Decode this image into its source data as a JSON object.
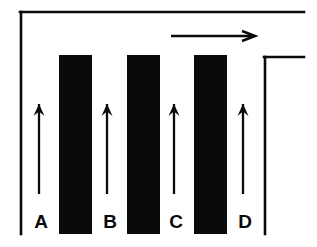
{
  "figure": {
    "background_color": "#ffffff",
    "ink_color": "#0a0a0a",
    "width": 317,
    "height": 247
  },
  "frame": {
    "name": "outer-boundary",
    "stroke_color": "#0a0a0a",
    "stroke_width": 2.6,
    "top_rail": {
      "x1": 20,
      "y1": 12,
      "x2": 304,
      "y2": 12
    },
    "left_rail": {
      "x1": 21,
      "y1": 12,
      "x2": 21,
      "y2": 234
    },
    "inner_top_rail": {
      "x1": 264,
      "y1": 57,
      "x2": 304,
      "y2": 57
    },
    "inner_right_rail": {
      "x1": 265,
      "y1": 57,
      "x2": 265,
      "y2": 234
    }
  },
  "bars": [
    {
      "id": "bar-1",
      "label": "A",
      "x": 59,
      "y": 55,
      "width": 33,
      "height": 179,
      "fill": "#0a0a0a"
    },
    {
      "id": "bar-2",
      "label": "B",
      "x": 127,
      "y": 55,
      "width": 33,
      "height": 179,
      "fill": "#0a0a0a"
    },
    {
      "id": "bar-3",
      "label": "C",
      "x": 194,
      "y": 55,
      "width": 33,
      "height": 179,
      "fill": "#0a0a0a"
    }
  ],
  "labels": [
    {
      "id": "label-a",
      "text": "A",
      "x": 41,
      "y": 228
    },
    {
      "id": "label-b",
      "text": "B",
      "x": 110,
      "y": 228
    },
    {
      "id": "label-c",
      "text": "C",
      "x": 176,
      "y": 228
    },
    {
      "id": "label-d",
      "text": "D",
      "x": 245,
      "y": 228
    }
  ],
  "up_arrows": [
    {
      "id": "up-arrow-a",
      "channel": "A",
      "x": 39,
      "tail_y": 194,
      "tip_y": 104
    },
    {
      "id": "up-arrow-b",
      "channel": "B",
      "x": 107,
      "tail_y": 194,
      "tip_y": 104
    },
    {
      "id": "up-arrow-c",
      "channel": "C",
      "x": 174,
      "tail_y": 194,
      "tip_y": 104
    },
    {
      "id": "up-arrow-d",
      "channel": "D",
      "x": 243,
      "tail_y": 194,
      "tip_y": 104
    }
  ],
  "flow_arrow": {
    "id": "horizontal-flow-arrow",
    "tail_x": 171,
    "tip_x": 255,
    "y": 36,
    "direction": "right"
  },
  "arrow_style": {
    "shaft_width": 2.3,
    "head_length": 12,
    "head_half_width": 5.5,
    "h_head_length": 13,
    "h_head_half_width": 5
  }
}
